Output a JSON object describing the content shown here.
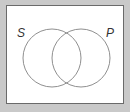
{
  "diagram": {
    "type": "venn",
    "sets": [
      {
        "label": "S"
      },
      {
        "label": "P"
      }
    ],
    "colors": {
      "background": "#c9c9c9",
      "panel": "#ffffff",
      "circle_stroke": "#8f8f8f",
      "label": "#333333"
    }
  }
}
